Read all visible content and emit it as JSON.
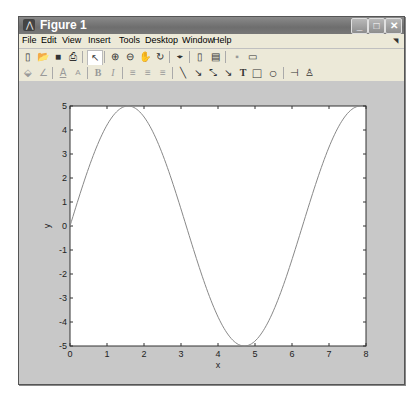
{
  "window": {
    "title": "Figure 1",
    "controls": {
      "minimize": "_",
      "maximize": "□",
      "close": "✕"
    }
  },
  "menubar": {
    "items": [
      "File",
      "Edit",
      "View",
      "Insert",
      "Tools",
      "Desktop",
      "Window",
      "Help"
    ],
    "corner_icon": "◥"
  },
  "toolbar1": {
    "tools": [
      {
        "name": "new-figure-icon",
        "glyph": "▯"
      },
      {
        "name": "open-file-icon",
        "glyph": "📂"
      },
      {
        "name": "save-icon",
        "glyph": "■"
      },
      {
        "name": "print-icon",
        "glyph": "⎙"
      },
      {
        "name": "edit-plot-arrow-icon",
        "glyph": "↖"
      },
      {
        "name": "zoom-in-icon",
        "glyph": "⊕"
      },
      {
        "name": "zoom-out-icon",
        "glyph": "⊖"
      },
      {
        "name": "pan-hand-icon",
        "glyph": "✋"
      },
      {
        "name": "rotate-3d-icon",
        "glyph": "↻"
      },
      {
        "name": "data-cursor-icon",
        "glyph": "⌖"
      },
      {
        "name": "colorbar-icon",
        "glyph": "▯"
      },
      {
        "name": "legend-icon",
        "glyph": "▤"
      },
      {
        "name": "hide-plot-tools-icon",
        "glyph": "▪"
      },
      {
        "name": "show-plot-tools-icon",
        "glyph": "▭"
      }
    ]
  },
  "toolbar2": {
    "tools": [
      {
        "name": "face-color-icon",
        "glyph": "⬙"
      },
      {
        "name": "edge-color-icon",
        "glyph": "∠"
      },
      {
        "name": "text-color-icon",
        "glyph": "A"
      },
      {
        "name": "font-icon",
        "glyph": "A"
      },
      {
        "name": "bold-icon",
        "glyph": "B"
      },
      {
        "name": "italic-icon",
        "glyph": "I"
      },
      {
        "name": "align-left-icon",
        "glyph": "≡"
      },
      {
        "name": "align-center-icon",
        "glyph": "≡"
      },
      {
        "name": "align-right-icon",
        "glyph": "≡"
      },
      {
        "name": "line-icon",
        "glyph": "╲"
      },
      {
        "name": "arrow-icon",
        "glyph": "↘"
      },
      {
        "name": "double-arrow-icon",
        "glyph": "⤡"
      },
      {
        "name": "text-arrow-icon",
        "glyph": "↘"
      },
      {
        "name": "text-box-icon",
        "glyph": "T"
      },
      {
        "name": "rectangle-icon",
        "glyph": "□"
      },
      {
        "name": "ellipse-icon",
        "glyph": "○"
      },
      {
        "name": "pin-icon",
        "glyph": "⊣"
      },
      {
        "name": "align-distribute-icon",
        "glyph": "♙"
      }
    ]
  },
  "colors": {
    "figure_bg": "#c8c8c8",
    "axes_bg": "#ffffff",
    "line": "#888888",
    "axis": "#333333"
  },
  "chart_data": {
    "type": "line",
    "title": "",
    "xlabel": "x",
    "ylabel": "y",
    "xlim": [
      0,
      8
    ],
    "ylim": [
      -5,
      5
    ],
    "xticks": [
      0,
      1,
      2,
      3,
      4,
      5,
      6,
      7,
      8
    ],
    "yticks": [
      -5,
      -4,
      -3,
      -2,
      -1,
      0,
      1,
      2,
      3,
      4,
      5
    ],
    "grid": false,
    "legend": null,
    "function": "y = 5*sin(x)",
    "series": [
      {
        "name": "y",
        "x": [
          0,
          0.5,
          1.0,
          1.5708,
          2.0,
          2.5,
          3.0,
          3.1416,
          3.5,
          4.0,
          4.5,
          4.7124,
          5.0,
          5.5,
          6.0,
          6.2832,
          6.5,
          7.0,
          7.5,
          7.854
        ],
        "y": [
          0,
          2.4,
          4.21,
          5.0,
          4.55,
          2.99,
          0.71,
          0,
          -1.75,
          -3.78,
          -4.89,
          -5.0,
          -4.79,
          -3.53,
          -1.4,
          0,
          1.08,
          3.28,
          4.69,
          5.0
        ]
      }
    ]
  }
}
